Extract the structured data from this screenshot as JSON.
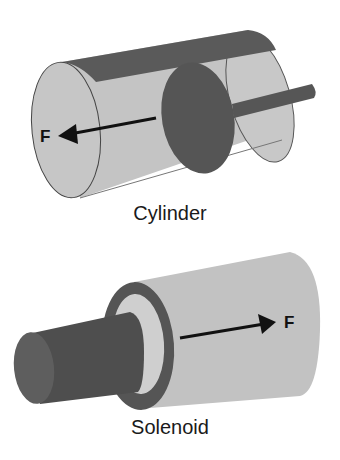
{
  "figures": [
    {
      "id": "cylinder",
      "caption": "Cylinder",
      "force_label": "F",
      "force_direction": "left"
    },
    {
      "id": "solenoid",
      "caption": "Solenoid",
      "force_label": "F",
      "force_direction": "right"
    }
  ],
  "colors": {
    "light_gray": "#c4c4c4",
    "mid_gray": "#bdbdbd",
    "dark_gray": "#565656",
    "darker_gray": "#4a4a4a",
    "outline": "#444444",
    "arrow": "#111111",
    "background": "#ffffff"
  }
}
